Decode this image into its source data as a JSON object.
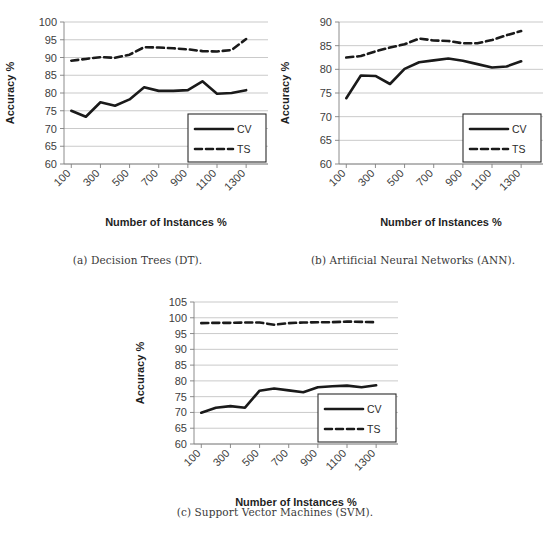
{
  "figure": {
    "panels": [
      {
        "id": "a",
        "caption": "(a)  Decision Trees (DT).",
        "chart_data": {
          "type": "line",
          "title": "",
          "xlabel": "Number of Instances %",
          "ylabel": "Accuracy %",
          "ylim": [
            60,
            100
          ],
          "ytick_step": 5,
          "yticks": [
            "60",
            "65",
            "70",
            "75",
            "80",
            "85",
            "90",
            "95",
            "100"
          ],
          "grid": true,
          "legend_position": "lower-right",
          "x": [
            100,
            200,
            300,
            400,
            500,
            600,
            700,
            800,
            900,
            1000,
            1100,
            1200,
            1300,
            1400
          ],
          "xtick_labels": [
            "100",
            "300",
            "500",
            "700",
            "900",
            "1100",
            "1300"
          ],
          "series": [
            {
              "name": "CV",
              "style": "solid",
              "values": [
                75.0,
                73.3,
                77.4,
                76.4,
                78.2,
                81.6,
                80.6,
                80.6,
                80.8,
                83.3,
                79.8,
                80.0,
                80.8
              ]
            },
            {
              "name": "TS",
              "style": "dashed",
              "values": [
                89.1,
                89.6,
                90.1,
                89.9,
                90.8,
                92.9,
                92.8,
                92.6,
                92.3,
                91.8,
                91.7,
                92.1,
                95.2
              ]
            }
          ]
        }
      },
      {
        "id": "b",
        "caption": "(b)  Artificial Neural Networks (ANN).",
        "chart_data": {
          "type": "line",
          "title": "",
          "xlabel": "Number of Instances %",
          "ylabel": "Accuracy %",
          "ylim": [
            60,
            90
          ],
          "ytick_step": 5,
          "yticks": [
            "60",
            "65",
            "70",
            "75",
            "80",
            "85",
            "90"
          ],
          "grid": true,
          "legend_position": "lower-right",
          "x": [
            100,
            200,
            300,
            400,
            500,
            600,
            700,
            800,
            900,
            1000,
            1100,
            1200,
            1300,
            1400
          ],
          "xtick_labels": [
            "100",
            "300",
            "500",
            "700",
            "900",
            "1100",
            "1300"
          ],
          "series": [
            {
              "name": "CV",
              "style": "solid",
              "values": [
                73.9,
                78.7,
                78.6,
                76.9,
                80.1,
                81.5,
                81.9,
                82.3,
                81.8,
                81.1,
                80.4,
                80.6,
                81.7
              ]
            },
            {
              "name": "TS",
              "style": "dashed",
              "values": [
                82.5,
                82.8,
                83.8,
                84.6,
                85.3,
                86.5,
                86.1,
                86.0,
                85.5,
                85.5,
                86.2,
                87.2,
                88.1
              ]
            }
          ]
        }
      },
      {
        "id": "c",
        "caption": "(c)  Support Vector Machines (SVM).",
        "chart_data": {
          "type": "line",
          "title": "",
          "xlabel": "Number of Instances %",
          "ylabel": "Accuracy %",
          "ylim": [
            60,
            105
          ],
          "ytick_step": 5,
          "yticks": [
            "60",
            "65",
            "70",
            "75",
            "80",
            "85",
            "90",
            "95",
            "100",
            "105"
          ],
          "grid": true,
          "legend_position": "lower-right",
          "x": [
            100,
            200,
            300,
            400,
            500,
            600,
            700,
            800,
            900,
            1000,
            1100,
            1200,
            1300,
            1400
          ],
          "xtick_labels": [
            "100",
            "300",
            "500",
            "700",
            "900",
            "1100",
            "1300"
          ],
          "series": [
            {
              "name": "CV",
              "style": "solid",
              "values": [
                69.9,
                71.5,
                72.0,
                71.5,
                76.9,
                77.6,
                77.0,
                76.4,
                78.0,
                78.3,
                78.5,
                78.0,
                78.6
              ]
            },
            {
              "name": "TS",
              "style": "dashed",
              "values": [
                98.3,
                98.4,
                98.4,
                98.5,
                98.5,
                97.8,
                98.3,
                98.5,
                98.6,
                98.6,
                98.8,
                98.7,
                98.6
              ]
            }
          ]
        }
      }
    ]
  }
}
